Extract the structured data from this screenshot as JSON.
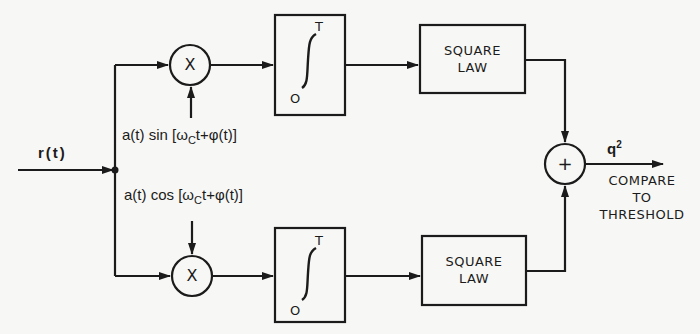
{
  "diagram": {
    "type": "quadrature-receiver-block-diagram",
    "input": {
      "label": "r(t)"
    },
    "branches": [
      {
        "id": "in-phase-sine",
        "multiplier": {
          "symbol": "X"
        },
        "reference_signal": {
          "prefix": "a(t) sin [ω",
          "subscript": "C",
          "suffix": "t+φ(t)]"
        },
        "integrator": {
          "upper_limit": "T",
          "lower_limit": "O"
        },
        "square_law": {
          "line1": "SQUARE",
          "line2": "LAW"
        }
      },
      {
        "id": "quadrature-cosine",
        "multiplier": {
          "symbol": "X"
        },
        "reference_signal": {
          "prefix": "a(t) cos [ω",
          "subscript": "C",
          "suffix": "t+φ(t)]"
        },
        "integrator": {
          "upper_limit": "T",
          "lower_limit": "O"
        },
        "square_law": {
          "line1": "SQUARE",
          "line2": "LAW"
        }
      }
    ],
    "summer": {
      "symbol": "+"
    },
    "output": {
      "label_base": "q",
      "label_exp": "2",
      "note_lines": [
        "COMPARE",
        "TO",
        "THRESHOLD"
      ]
    },
    "colors": {
      "ink": "#1b1b1b",
      "paper": "#f7f7f5"
    }
  }
}
